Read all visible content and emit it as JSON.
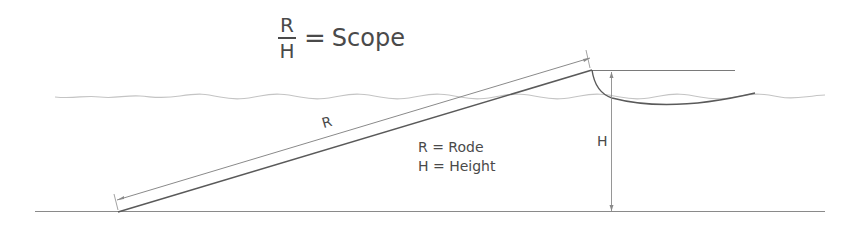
{
  "formula": {
    "numerator": "R",
    "denominator": "H",
    "equals": "=",
    "result": "Scope"
  },
  "labels": {
    "rode_label": "R",
    "height_label": "H"
  },
  "legend": {
    "items": [
      {
        "text": "R = Rode"
      },
      {
        "text": "H = Height"
      }
    ]
  },
  "colors": {
    "line": "#555555",
    "water": "#bbbbbb",
    "text": "#4a4a4a"
  }
}
